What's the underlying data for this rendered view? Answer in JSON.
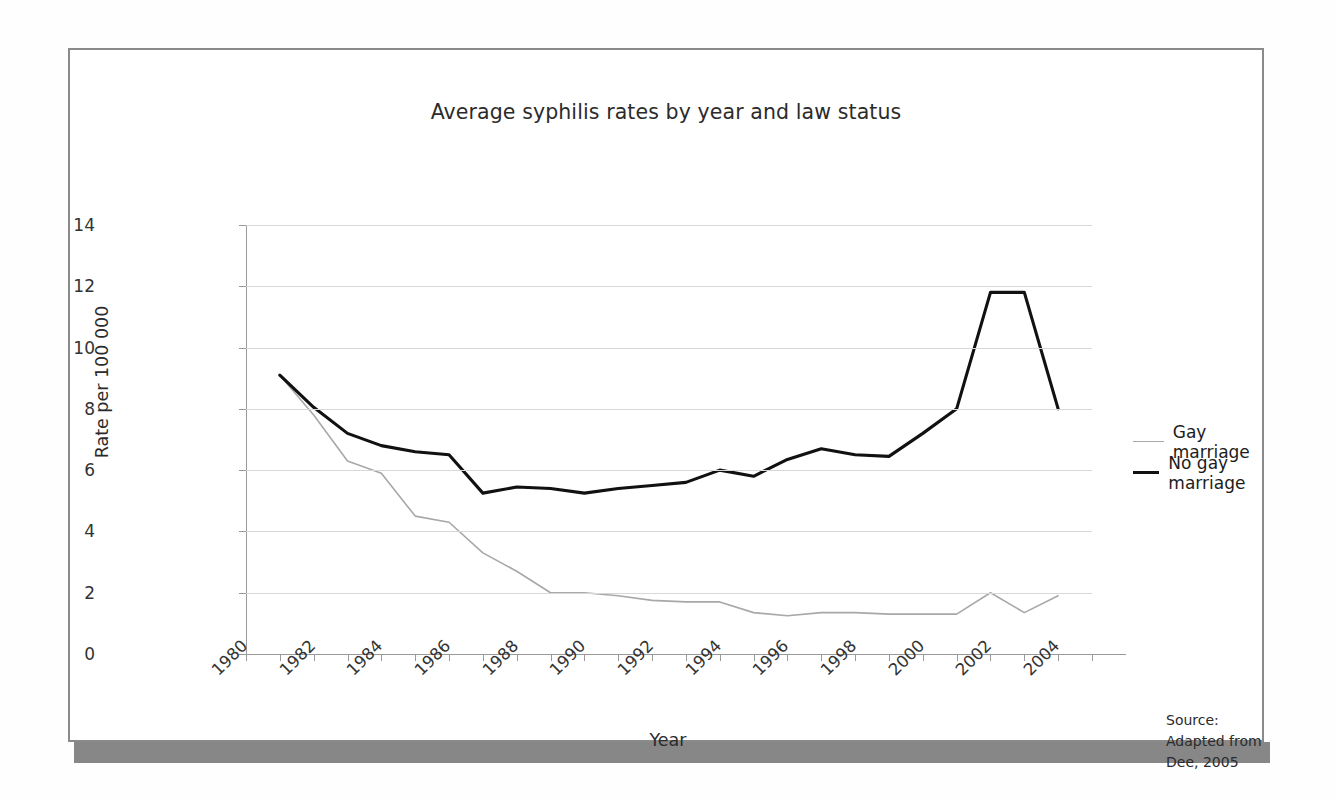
{
  "figure": {
    "title": "Average syphilis rates by year and law status",
    "xlabel": "Year",
    "ylabel": "Rate per 100 000",
    "source_label": "Source:",
    "source_text": "Adapted from Dee, 2005"
  },
  "legend": {
    "items": [
      {
        "label": "Gay marriage",
        "color": "#a8a8a8"
      },
      {
        "label": "No gay marriage",
        "color": "#111111"
      }
    ]
  },
  "axes": {
    "y_ticks": [
      "0",
      "2",
      "4",
      "6",
      "8",
      "10",
      "12",
      "14"
    ],
    "x_ticks": [
      "1980",
      "1982",
      "1984",
      "1986",
      "1988",
      "1990",
      "1992",
      "1994",
      "1996",
      "1998",
      "2000",
      "2002",
      "2004"
    ]
  },
  "chart_data": {
    "type": "line",
    "title": "Average syphilis rates by year and law status",
    "xlabel": "Year",
    "ylabel": "Rate per 100 000",
    "xlim": [
      1980,
      2005
    ],
    "ylim": [
      0,
      14
    ],
    "ytick_step": 2,
    "grid": "horizontal",
    "legend_position": "right",
    "annotation": "Source: Adapted from Dee, 2005",
    "x": [
      1981,
      1982,
      1983,
      1984,
      1985,
      1986,
      1987,
      1988,
      1989,
      1990,
      1991,
      1992,
      1993,
      1994,
      1995,
      1996,
      1997,
      1998,
      1999,
      2000,
      2001,
      2002,
      2003,
      2004
    ],
    "series": [
      {
        "name": "Gay marriage",
        "color": "#a8a8a8",
        "values": [
          9.1,
          7.8,
          6.3,
          5.9,
          4.5,
          4.3,
          3.3,
          2.7,
          2.0,
          2.0,
          1.9,
          1.75,
          1.7,
          1.7,
          1.35,
          1.25,
          1.35,
          1.35,
          1.3,
          1.3,
          1.3,
          2.0,
          1.35,
          1.9
        ]
      },
      {
        "name": "No gay marriage",
        "color": "#111111",
        "values": [
          9.1,
          8.05,
          7.2,
          6.8,
          6.6,
          6.5,
          5.25,
          5.45,
          5.4,
          5.25,
          5.4,
          5.5,
          5.6,
          6.0,
          5.8,
          6.35,
          6.7,
          6.5,
          6.45,
          7.2,
          8.0,
          11.8,
          11.8,
          8.0
        ]
      }
    ]
  }
}
